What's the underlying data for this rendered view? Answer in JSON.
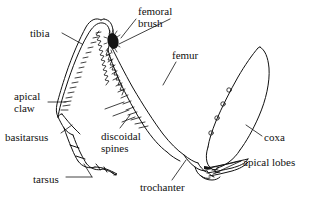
{
  "figure": {
    "type": "anatomical-line-drawing",
    "background_color": "#ffffff",
    "ink_color": "#111111",
    "width": 310,
    "height": 212,
    "labels": [
      {
        "id": "tibia",
        "text": "tibia",
        "x": 30,
        "y": 28,
        "align": "left"
      },
      {
        "id": "femoral-brush",
        "text": "femoral\nbrush",
        "x": 138,
        "y": 7,
        "align": "left"
      },
      {
        "id": "femur",
        "text": "femur",
        "x": 172,
        "y": 50,
        "align": "left"
      },
      {
        "id": "apical-claw",
        "text": "apical\nclaw",
        "x": 14,
        "y": 92,
        "align": "left"
      },
      {
        "id": "basitarsus",
        "text": "basitarsus",
        "x": 6,
        "y": 133,
        "align": "left"
      },
      {
        "id": "discoidal-spines",
        "text": "discoidal\nspines",
        "x": 101,
        "y": 132,
        "align": "left"
      },
      {
        "id": "tarsus",
        "text": "tarsus",
        "x": 33,
        "y": 175,
        "align": "left"
      },
      {
        "id": "trochanter",
        "text": "trochanter",
        "x": 140,
        "y": 183,
        "align": "left"
      },
      {
        "id": "coxa",
        "text": "coxa",
        "x": 264,
        "y": 133,
        "align": "left"
      },
      {
        "id": "apical-lobes",
        "text": "apical lobes",
        "x": 243,
        "y": 158,
        "align": "left"
      }
    ],
    "parts": [
      "tibia",
      "femoral brush",
      "femur",
      "apical claw",
      "basitarsus",
      "discoidal spines",
      "tarsus",
      "trochanter",
      "coxa",
      "apical lobes"
    ]
  }
}
